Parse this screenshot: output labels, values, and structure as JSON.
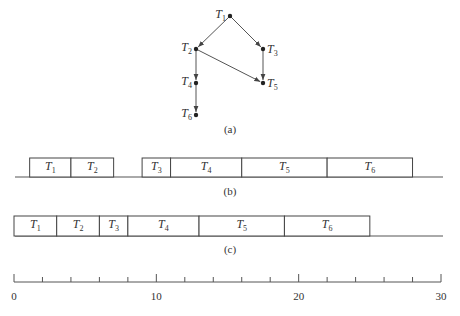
{
  "graph": {
    "caption": "(a)",
    "nodes": [
      {
        "id": "T1",
        "name": "T",
        "sub": "1",
        "x": 230,
        "y": 16,
        "label_side": "left"
      },
      {
        "id": "T2",
        "name": "T",
        "sub": "2",
        "x": 196,
        "y": 49,
        "label_side": "left"
      },
      {
        "id": "T3",
        "name": "T",
        "sub": "3",
        "x": 263,
        "y": 49,
        "label_side": "right"
      },
      {
        "id": "T4",
        "name": "T",
        "sub": "4",
        "x": 196,
        "y": 83,
        "label_side": "left"
      },
      {
        "id": "T5",
        "name": "T",
        "sub": "5",
        "x": 263,
        "y": 83,
        "label_side": "right"
      },
      {
        "id": "T6",
        "name": "T",
        "sub": "6",
        "x": 196,
        "y": 115,
        "label_side": "left"
      }
    ],
    "edges": [
      [
        "T1",
        "T2"
      ],
      [
        "T1",
        "T3"
      ],
      [
        "T2",
        "T4"
      ],
      [
        "T2",
        "T5"
      ],
      [
        "T3",
        "T5"
      ],
      [
        "T4",
        "T6"
      ]
    ]
  },
  "schedule_b": {
    "caption": "(b)",
    "tasks": [
      {
        "name": "T",
        "sub": "1",
        "start": 1.1,
        "end": 4
      },
      {
        "name": "T",
        "sub": "2",
        "start": 4,
        "end": 7
      },
      {
        "name": "T",
        "sub": "3",
        "start": 9,
        "end": 11
      },
      {
        "name": "T",
        "sub": "4",
        "start": 11,
        "end": 16
      },
      {
        "name": "T",
        "sub": "5",
        "start": 16,
        "end": 22
      },
      {
        "name": "T",
        "sub": "6",
        "start": 22,
        "end": 28
      }
    ]
  },
  "schedule_c": {
    "caption": "(c)",
    "tasks": [
      {
        "name": "T",
        "sub": "1",
        "start": 0,
        "end": 3
      },
      {
        "name": "T",
        "sub": "2",
        "start": 3,
        "end": 6
      },
      {
        "name": "T",
        "sub": "3",
        "start": 6,
        "end": 8
      },
      {
        "name": "T",
        "sub": "4",
        "start": 8,
        "end": 13
      },
      {
        "name": "T",
        "sub": "5",
        "start": 13,
        "end": 19
      },
      {
        "name": "T",
        "sub": "6",
        "start": 19,
        "end": 25
      }
    ]
  },
  "axis": {
    "min": 0,
    "max": 30,
    "tick_step": 2,
    "major_ticks": [
      0,
      10,
      20,
      30
    ],
    "tick_labels": [
      "0",
      "10",
      "20",
      "30"
    ]
  }
}
